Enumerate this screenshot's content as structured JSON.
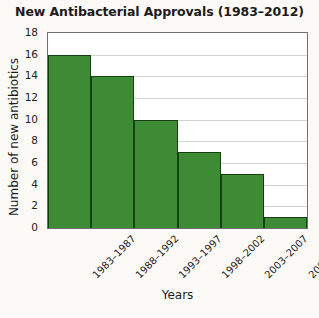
{
  "chart_data": {
    "type": "bar",
    "title": "New Antibacterial Approvals (1983–2012)",
    "xlabel": "Years",
    "ylabel": "Number of new antibiotics",
    "categories": [
      "1983–1987",
      "1988–1992",
      "1993–1997",
      "1998–2002",
      "2003–2007",
      "2008–2012"
    ],
    "values": [
      16,
      14,
      10,
      7,
      5,
      1
    ],
    "ylim": [
      0,
      18
    ],
    "ytick_step": 2,
    "yticks": [
      0,
      2,
      4,
      6,
      8,
      10,
      12,
      14,
      16,
      18
    ],
    "ytick_labels": [
      "0",
      "2",
      "4",
      "6",
      "8",
      "10",
      "12",
      "14",
      "16",
      "18"
    ],
    "grid": "horizontal",
    "legend": "none",
    "bar_color": "#3d8b35",
    "bar_edge_color": "#15400f",
    "gridline_color": "#d2d2d2",
    "axis_color": "#6f6f6f",
    "background_color": "#fbfaf7",
    "plot_background_color": "#ffffff"
  }
}
